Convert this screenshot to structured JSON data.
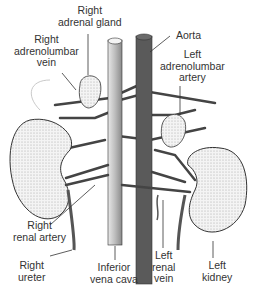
{
  "figure": {
    "labels": {
      "right_adrenal_gland": [
        "Right",
        "adrenal gland"
      ],
      "aorta": "Aorta",
      "right_adrenolumbar_vein": [
        "Right",
        "adrenolumbar",
        "vein"
      ],
      "left_adrenolumbar_artery": [
        "Left",
        "adrenolumbar",
        "artery"
      ],
      "right_renal_artery": [
        "Right",
        "renal artery"
      ],
      "right_ureter": [
        "Right",
        "ureter"
      ],
      "inferior_vena_cava": [
        "Inferior",
        "vena cava"
      ],
      "left_renal_vein": [
        "Left",
        "renal",
        "vein"
      ],
      "left_kidney": [
        "Left",
        "kidney"
      ]
    },
    "colors": {
      "vena_cava": "#c8c8c8",
      "aorta": "#5a5a5a",
      "kidney": "#f2f2f2",
      "line": "#333333"
    }
  }
}
